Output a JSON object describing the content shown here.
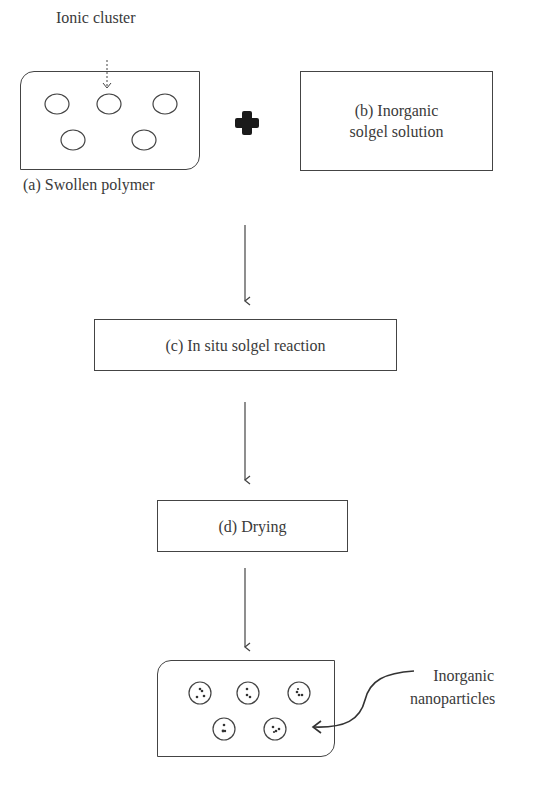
{
  "diagram": {
    "type": "flowchart",
    "steps": {
      "a": {
        "label": "(a) Swollen polymer",
        "annotation": "Ionic cluster"
      },
      "b": {
        "label_line1": "(b) Inorganic",
        "label_line2": "solgel solution"
      },
      "c": {
        "label": "(c) In situ solgel reaction"
      },
      "d": {
        "label": "(d) Drying"
      },
      "e": {
        "annotation_line1": "Inorganic",
        "annotation_line2": "nanoparticles"
      }
    },
    "operator": "plus-icon",
    "colors": {
      "line": "#444444",
      "text": "#3a3a3a",
      "plus": "#1a1a1a",
      "background": "#ffffff"
    }
  }
}
